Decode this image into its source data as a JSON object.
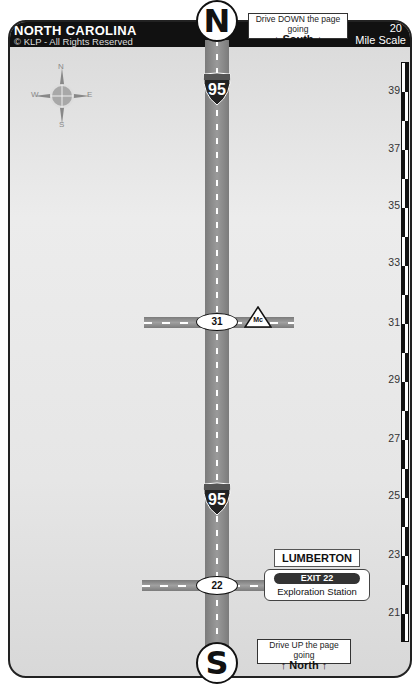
{
  "header": {
    "state": "NORTH CAROLINA",
    "copyright": "© KLP - All Rights Reserved",
    "mile_scale_number": "20",
    "mile_scale_label": "Mile Scale"
  },
  "compass": {
    "n": "N",
    "s": "S",
    "e": "E",
    "w": "W"
  },
  "north_marker": "N",
  "south_marker": "S",
  "direction_top": {
    "line1": "Drive DOWN the page going",
    "line2": "South",
    "arrow": "↓"
  },
  "direction_bottom": {
    "line1": "Drive UP the page going",
    "line2": "North",
    "arrow": "↑"
  },
  "highway": {
    "shield_top_label": "INTERSTATE",
    "number": "95"
  },
  "exits": [
    {
      "number": "31",
      "sign": "Mc"
    },
    {
      "number": "22",
      "city": "LUMBERTON",
      "exit_label": "EXIT 22",
      "stop": "Exploration Station"
    }
  ],
  "scale_marks": [
    "39",
    "37",
    "35",
    "33",
    "31",
    "29",
    "27",
    "25",
    "23",
    "21"
  ]
}
